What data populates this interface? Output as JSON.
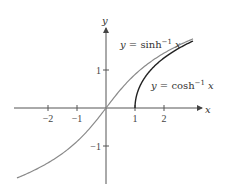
{
  "chart_data": {
    "type": "line",
    "title": "",
    "xlabel": "x",
    "ylabel": "y",
    "xlim": [
      -3.1,
      3.2
    ],
    "ylim": [
      -1.9,
      2.1
    ],
    "grid": false,
    "legend": "inline annotations",
    "x_ticks": [
      -2,
      -1,
      1,
      2
    ],
    "x_tick_labels": [
      "−2",
      "−1",
      "1",
      "2"
    ],
    "y_ticks": [
      1,
      -1
    ],
    "y_tick_labels": [
      "1",
      "−1"
    ],
    "series": [
      {
        "name": "y = sinh⁻¹ x",
        "label_main": "y = sinh",
        "label_sup": "−1",
        "label_var": "x",
        "color": "#8a8a8a",
        "x": [
          -3,
          -2,
          -1,
          -0.5,
          0,
          0.5,
          1,
          2,
          3
        ],
        "values": [
          -1.82,
          -1.44,
          -0.88,
          -0.48,
          0,
          0.48,
          0.88,
          1.44,
          1.82
        ]
      },
      {
        "name": "y = cosh⁻¹ x",
        "label_main": "y = cosh",
        "label_sup": "−1",
        "label_var": "x",
        "color": "#222222",
        "x": [
          1,
          1.1,
          1.25,
          1.5,
          2,
          2.5,
          3
        ],
        "values": [
          0,
          0.44,
          0.69,
          0.96,
          1.32,
          1.57,
          1.76
        ]
      }
    ]
  },
  "axes": {
    "x_label": "x",
    "y_label": "y"
  }
}
